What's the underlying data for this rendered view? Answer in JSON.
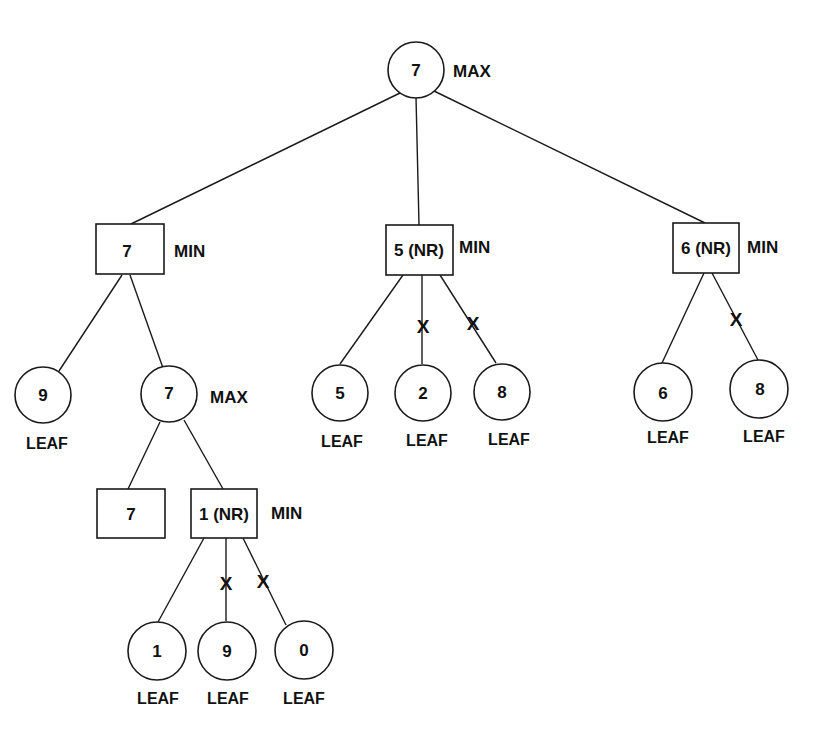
{
  "colors": {
    "stroke": "#1a1a1a",
    "text": "#111111",
    "background": "#ffffff"
  },
  "labels": {
    "max": "MAX",
    "min": "MIN",
    "leaf": "LEAF",
    "prune": "X"
  },
  "nodes": {
    "root": {
      "value": "7",
      "type": "MAX",
      "shape": "circle"
    },
    "min_left": {
      "value": "7",
      "type": "MIN",
      "shape": "box"
    },
    "min_mid": {
      "value": "5 (NR)",
      "type": "MIN",
      "shape": "box"
    },
    "min_right": {
      "value": "6 (NR)",
      "type": "MIN",
      "shape": "box"
    },
    "leaf_9a": {
      "value": "9",
      "type": "LEAF",
      "shape": "circle"
    },
    "max_inner": {
      "value": "7",
      "type": "MAX",
      "shape": "circle"
    },
    "leaf_5": {
      "value": "5",
      "type": "LEAF",
      "shape": "circle"
    },
    "leaf_2": {
      "value": "2",
      "type": "LEAF",
      "shape": "circle"
    },
    "leaf_8a": {
      "value": "8",
      "type": "LEAF",
      "shape": "circle"
    },
    "leaf_6": {
      "value": "6",
      "type": "LEAF",
      "shape": "circle"
    },
    "leaf_8b": {
      "value": "8",
      "type": "LEAF",
      "shape": "circle"
    },
    "box_7": {
      "value": "7",
      "type": "",
      "shape": "box"
    },
    "min_inner": {
      "value": "1 (NR)",
      "type": "MIN",
      "shape": "box"
    },
    "leaf_1": {
      "value": "1",
      "type": "LEAF",
      "shape": "circle"
    },
    "leaf_9b": {
      "value": "9",
      "type": "LEAF",
      "shape": "circle"
    },
    "leaf_0": {
      "value": "0",
      "type": "LEAF",
      "shape": "circle"
    }
  },
  "edges": [
    {
      "from": "root",
      "to": "min_left",
      "pruned": false
    },
    {
      "from": "root",
      "to": "min_mid",
      "pruned": false
    },
    {
      "from": "root",
      "to": "min_right",
      "pruned": false
    },
    {
      "from": "min_left",
      "to": "leaf_9a",
      "pruned": false
    },
    {
      "from": "min_left",
      "to": "max_inner",
      "pruned": false
    },
    {
      "from": "min_mid",
      "to": "leaf_5",
      "pruned": false
    },
    {
      "from": "min_mid",
      "to": "leaf_2",
      "pruned": true
    },
    {
      "from": "min_mid",
      "to": "leaf_8a",
      "pruned": true
    },
    {
      "from": "min_right",
      "to": "leaf_6",
      "pruned": false
    },
    {
      "from": "min_right",
      "to": "leaf_8b",
      "pruned": true
    },
    {
      "from": "max_inner",
      "to": "box_7",
      "pruned": false
    },
    {
      "from": "max_inner",
      "to": "min_inner",
      "pruned": false
    },
    {
      "from": "min_inner",
      "to": "leaf_1",
      "pruned": false
    },
    {
      "from": "min_inner",
      "to": "leaf_9b",
      "pruned": true
    },
    {
      "from": "min_inner",
      "to": "leaf_0",
      "pruned": true
    }
  ]
}
